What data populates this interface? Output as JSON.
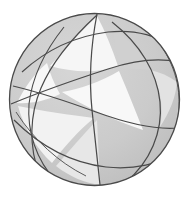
{
  "figure": {
    "width": 189,
    "height": 198
  },
  "canvas": {
    "background": "#ffffff"
  },
  "sphere": {
    "label": "sphere-outline",
    "center_x": 94.5,
    "center_y": 99.5,
    "radius_x": 85,
    "radius_y": 86,
    "fill": "#c9c9c9",
    "stroke": "#4a4a4a",
    "stroke_width": 1.3,
    "rim_shadow": "#b3b3b3"
  },
  "palette": {
    "shade_dark": "#c9c9c9",
    "shade_mid": "#d4d4d4",
    "shade_light": "#f3f3f3",
    "shade_white": "#fbfbfb",
    "line": "#4a4a4a",
    "line_soft": "#6d6d6d",
    "background": "#ffffff"
  },
  "regions": [
    {
      "name": "upper-left-cap",
      "shade": "#cccccc"
    },
    {
      "name": "upper-center-triangle",
      "shade": "#f6f6f6"
    },
    {
      "name": "left-triangle",
      "shade": "#f7f7f7"
    },
    {
      "name": "central-triangle",
      "shade": "#f8f8f8"
    },
    {
      "name": "lower-left-lune",
      "shade": "#f2f2f2"
    },
    {
      "name": "lower-center-band",
      "shade": "#cdcdcd"
    },
    {
      "name": "right-lune",
      "shade": "#e2e2e2"
    },
    {
      "name": "right-edge-sliver",
      "shade": "#d8d8d8"
    }
  ],
  "great_circles": [
    {
      "name": "meridian-vertical",
      "kind": "meridian",
      "orientation": "near-vertical",
      "rx": 8,
      "ry": 86,
      "rotation_deg": 2,
      "stroke": "#4a4a4a"
    },
    {
      "name": "meridian-left-oblique",
      "kind": "meridian",
      "orientation": "oblique-left",
      "rx": 32,
      "ry": 86,
      "rotation_deg": -16,
      "stroke": "#4a4a4a"
    },
    {
      "name": "meridian-right-edge",
      "kind": "meridian",
      "orientation": "near-limb-right",
      "rx": 78,
      "ry": 86,
      "rotation_deg": 6,
      "stroke": "#4a4a4a"
    },
    {
      "name": "equator-tilted-a",
      "kind": "equator",
      "orientation": "tilted-down-right",
      "rx": 85,
      "ry": 30,
      "rotation_deg": 22,
      "stroke": "#4a4a4a"
    },
    {
      "name": "equator-tilted-b",
      "kind": "equator",
      "orientation": "tilted-up-right",
      "rx": 85,
      "ry": 34,
      "rotation_deg": -24,
      "stroke": "#4a4a4a"
    },
    {
      "name": "equator-low",
      "kind": "equator",
      "orientation": "shallow-lower",
      "rx": 83,
      "ry": 22,
      "rotation_deg": 8,
      "stroke": "#4a4a4a"
    }
  ],
  "intersections": [
    {
      "name": "node-top",
      "x": 97,
      "y": 15
    },
    {
      "name": "node-bottom",
      "x": 100,
      "y": 184
    },
    {
      "name": "node-upper-left",
      "x": 47,
      "y": 62
    },
    {
      "name": "node-lower-left",
      "x": 27,
      "y": 125
    },
    {
      "name": "node-right-upper",
      "x": 150,
      "y": 70
    },
    {
      "name": "node-right-lower",
      "x": 148,
      "y": 135
    },
    {
      "name": "node-center-left",
      "x": 62,
      "y": 90
    }
  ]
}
